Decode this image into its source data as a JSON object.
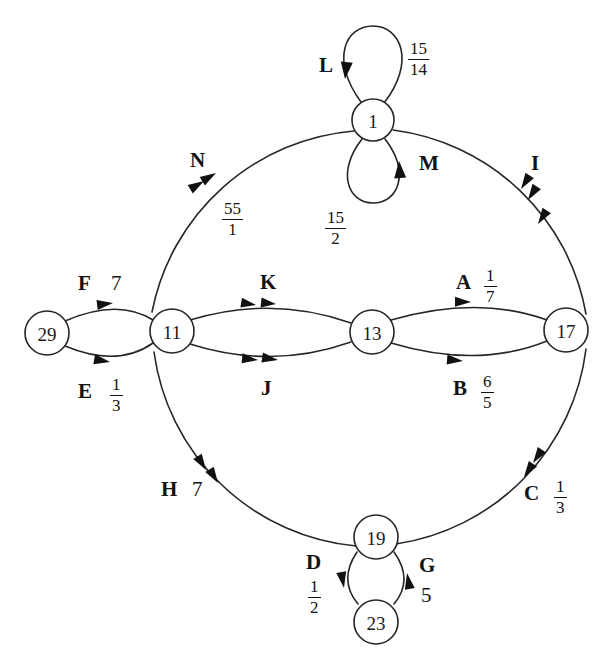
{
  "figure": {
    "kind": "directed-graph",
    "style": {
      "stroke": "#262626",
      "node_fill": "#ffffff",
      "text": "#121212",
      "background": "#ffffff"
    }
  },
  "nodes": [
    {
      "id": "n1",
      "label": "1",
      "cx": 373,
      "cy": 120,
      "r": 21
    },
    {
      "id": "n11",
      "label": "11",
      "cx": 172,
      "cy": 331,
      "r": 22
    },
    {
      "id": "n13",
      "label": "13",
      "cx": 372,
      "cy": 332,
      "r": 22
    },
    {
      "id": "n17",
      "label": "17",
      "cx": 566,
      "cy": 330,
      "r": 22
    },
    {
      "id": "n19",
      "label": "19",
      "cx": 376,
      "cy": 537,
      "r": 22
    },
    {
      "id": "n23",
      "label": "23",
      "cx": 376,
      "cy": 622,
      "r": 22
    },
    {
      "id": "n29",
      "label": "29",
      "cx": 47,
      "cy": 333,
      "r": 22
    }
  ],
  "edges": [
    {
      "id": "A",
      "name": "A",
      "from": "13",
      "to": "17",
      "weight": "1/7",
      "weight_kind": "fraction",
      "numerator": "1",
      "denominator": "7",
      "arrowheads": 1
    },
    {
      "id": "B",
      "name": "B",
      "from": "17",
      "to": "13",
      "weight": "6/5",
      "weight_kind": "fraction",
      "numerator": "6",
      "denominator": "5",
      "arrowheads": 1
    },
    {
      "id": "C",
      "name": "C",
      "from": "19",
      "to": "17",
      "weight": "1/3",
      "weight_kind": "fraction",
      "numerator": "1",
      "denominator": "3",
      "arrowheads": 2
    },
    {
      "id": "D",
      "name": "D",
      "from": "19",
      "to": "23",
      "weight": "1/2",
      "weight_kind": "fraction",
      "numerator": "1",
      "denominator": "2",
      "arrowheads": 1
    },
    {
      "id": "E",
      "name": "E",
      "from": "11",
      "to": "29",
      "weight": "1/3",
      "weight_kind": "fraction",
      "numerator": "1",
      "denominator": "3",
      "arrowheads": 1
    },
    {
      "id": "F",
      "name": "F",
      "from": "29",
      "to": "11",
      "weight": "7",
      "weight_kind": "integer",
      "arrowheads": 1
    },
    {
      "id": "G",
      "name": "G",
      "from": "23",
      "to": "19",
      "weight": "5",
      "weight_kind": "integer",
      "arrowheads": 1
    },
    {
      "id": "H",
      "name": "H",
      "from": "19",
      "to": "11",
      "weight": "7",
      "weight_kind": "integer",
      "arrowheads": 2
    },
    {
      "id": "I",
      "name": "I",
      "from": "17",
      "to": "1",
      "weight": "",
      "weight_kind": "none",
      "arrowheads": 3
    },
    {
      "id": "J",
      "name": "J",
      "from": "13",
      "to": "11",
      "weight": "",
      "weight_kind": "none",
      "arrowheads": 2
    },
    {
      "id": "K",
      "name": "K",
      "from": "11",
      "to": "13",
      "weight": "",
      "weight_kind": "none",
      "arrowheads": 2
    },
    {
      "id": "L",
      "name": "L",
      "from": "1",
      "to": "1",
      "weight": "15/14",
      "weight_kind": "fraction",
      "numerator": "15",
      "denominator": "14",
      "arrowheads": 1,
      "self_loop": "up"
    },
    {
      "id": "M",
      "name": "M",
      "from": "1",
      "to": "1",
      "weight": "15/2",
      "weight_kind": "fraction",
      "numerator": "15",
      "denominator": "2",
      "arrowheads": 1,
      "self_loop": "down"
    },
    {
      "id": "N",
      "name": "N",
      "from": "1",
      "to": "11",
      "weight": "55/1",
      "weight_kind": "fraction",
      "numerator": "55",
      "denominator": "1",
      "arrowheads": 2
    }
  ],
  "labels": {
    "A": {
      "name": "A",
      "num": "1",
      "den": "7"
    },
    "B": {
      "name": "B",
      "num": "6",
      "den": "5"
    },
    "C": {
      "name": "C",
      "num": "1",
      "den": "3"
    },
    "D": {
      "name": "D",
      "num": "1",
      "den": "2"
    },
    "E": {
      "name": "E",
      "num": "1",
      "den": "3"
    },
    "F": {
      "name": "F",
      "int": "7"
    },
    "G": {
      "name": "G",
      "int": "5"
    },
    "H": {
      "name": "H",
      "int": "7"
    },
    "I": {
      "name": "I"
    },
    "J": {
      "name": "J"
    },
    "K": {
      "name": "K"
    },
    "L": {
      "name": "L",
      "num": "15",
      "den": "14"
    },
    "M": {
      "name": "M",
      "num": "15",
      "den": "2"
    },
    "N": {
      "name": "N",
      "num": "55",
      "den": "1"
    }
  }
}
